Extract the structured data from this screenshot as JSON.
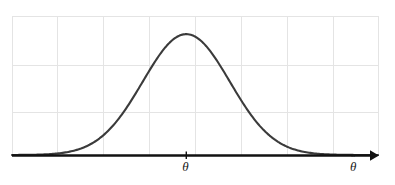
{
  "figure": {
    "background_color": "#ffffff",
    "grid_color": "#e3e3e3",
    "curve_color": "#3a3a3a",
    "axis_color": "#111111"
  },
  "labels": {
    "center_tick": "θ",
    "x_axis_base": "θ",
    "x_axis_hat": "ˆ",
    "x_axis_full": "θ̂"
  },
  "chart_data": {
    "type": "line",
    "title": "",
    "subtitle": "",
    "xlabel": "θ̂",
    "ylabel": "",
    "grid": true,
    "legend": null,
    "annotations": [
      {
        "text": "θ",
        "x": 0,
        "y": 0,
        "position": "below-axis-center"
      },
      {
        "text": "θ̂",
        "x": 4.0,
        "y": 0,
        "position": "axis-end-right"
      }
    ],
    "axis": {
      "x_arrow": true,
      "x_start_px": 12,
      "x_end_px": 378,
      "baseline_y_px": 155,
      "xlim": [
        -4.0,
        4.4
      ],
      "ylim": [
        0,
        1.15
      ],
      "x_ticks": [
        0
      ],
      "x_tick_labels": [
        "θ"
      ],
      "y_ticks": [],
      "y_tick_labels": []
    },
    "gridlines": {
      "vertical_x_px": [
        12,
        57,
        103,
        149,
        196,
        241,
        287,
        333,
        378
      ],
      "horizontal_y_px": [
        16,
        65,
        112,
        155
      ]
    },
    "series": [
      {
        "name": "sampling distribution of theta-hat",
        "distribution": "normal",
        "mean": 0,
        "sd": 1,
        "x": [
          -4.0,
          -3.6,
          -3.2,
          -2.8,
          -2.4,
          -2.0,
          -1.6,
          -1.2,
          -0.8,
          -0.4,
          0.0,
          0.4,
          0.8,
          1.2,
          1.6,
          2.0,
          2.4,
          2.8,
          3.2,
          3.6,
          4.0
        ],
        "values": [
          0.0,
          0.002,
          0.006,
          0.016,
          0.056,
          0.135,
          0.278,
          0.487,
          0.726,
          0.923,
          1.0,
          0.923,
          0.726,
          0.487,
          0.278,
          0.135,
          0.056,
          0.016,
          0.006,
          0.002,
          0.0
        ]
      }
    ]
  }
}
